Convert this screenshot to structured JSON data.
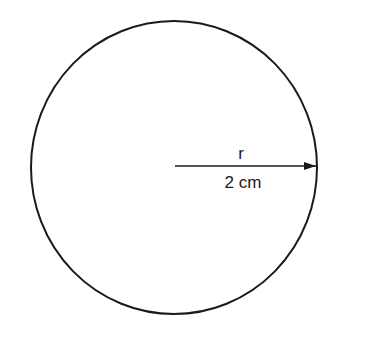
{
  "diagram": {
    "shape": "circle",
    "radius_label": "r",
    "radius_value": "2 cm",
    "colors": {
      "stroke": "#1a1a1a",
      "background": "#ffffff"
    }
  }
}
